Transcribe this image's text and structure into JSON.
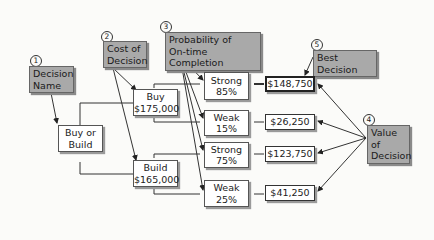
{
  "annotations": [
    {
      "num": "1",
      "text_lines": [
        "Decision",
        "Name"
      ]
    },
    {
      "num": "2",
      "text_lines": [
        "Cost of",
        "Decision"
      ]
    },
    {
      "num": "3",
      "text_lines": [
        "Probability of",
        "On-time Completion"
      ]
    },
    {
      "num": "4",
      "text_lines": [
        "Value of",
        "Decision"
      ]
    },
    {
      "num": "5",
      "text_lines": [
        "Best Decision"
      ]
    }
  ],
  "root": {
    "lines": [
      "Buy or",
      "Build"
    ]
  },
  "decisions": [
    {
      "name": "Buy",
      "cost": "$175,000"
    },
    {
      "name": "Build",
      "cost": "$165,000"
    }
  ],
  "outcomes": [
    {
      "label": "Strong",
      "prob": "85%",
      "value": "$148,750",
      "best": true
    },
    {
      "label": "Weak",
      "prob": "15%",
      "value": "$26,250",
      "best": false
    },
    {
      "label": "Strong",
      "prob": "75%",
      "value": "$123,750",
      "best": false
    },
    {
      "label": "Weak",
      "prob": "25%",
      "value": "$41,250",
      "best": false
    }
  ]
}
